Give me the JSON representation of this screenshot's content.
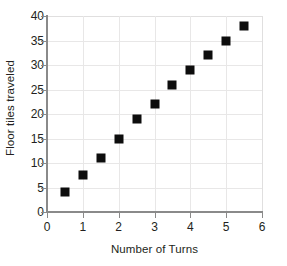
{
  "chart_data": {
    "type": "scatter",
    "title": "",
    "xlabel": "Number of Turns",
    "ylabel": "Floor tiles traveled",
    "xlim": [
      0,
      6
    ],
    "ylim": [
      0,
      40
    ],
    "x_ticks": [
      0,
      1,
      2,
      3,
      4,
      5,
      6
    ],
    "y_ticks": [
      0,
      5,
      10,
      15,
      20,
      25,
      30,
      35,
      40
    ],
    "grid": true,
    "legend": "none",
    "marker": {
      "shape": "square",
      "color": "#0d0d0d",
      "size_px": 9
    },
    "series": [
      {
        "name": "Floor tiles traveled",
        "points": [
          {
            "x": 0.5,
            "y": 4
          },
          {
            "x": 1,
            "y": 7.5
          },
          {
            "x": 1.5,
            "y": 11
          },
          {
            "x": 2,
            "y": 15
          },
          {
            "x": 2.5,
            "y": 19
          },
          {
            "x": 3,
            "y": 22
          },
          {
            "x": 3.5,
            "y": 26
          },
          {
            "x": 4,
            "y": 29
          },
          {
            "x": 4.5,
            "y": 32
          },
          {
            "x": 5,
            "y": 35
          },
          {
            "x": 5.5,
            "y": 38
          }
        ]
      }
    ]
  },
  "axis_style": {
    "axis_line_color": "#8a8a8a",
    "gridline_color": "#e8e7e7",
    "text_color": "#231f20",
    "background": "#ffffff"
  }
}
